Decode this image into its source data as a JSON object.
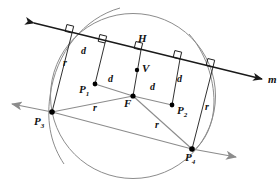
{
  "diagram": {
    "colors": {
      "line": "#1a1a1a",
      "arc": "#8c8c8c",
      "ray": "#8c8c8c",
      "point": "#000000",
      "label": "#111111"
    },
    "directrix": {
      "name": "m",
      "label": "m",
      "from": [
        30,
        22
      ],
      "to": [
        265,
        80
      ],
      "arrow_start": true,
      "arrow_end": true
    },
    "points": [
      {
        "id": "F",
        "label": "F",
        "sub": "",
        "x": 133,
        "y": 96,
        "label_x": 125,
        "label_y": 99,
        "dot": true
      },
      {
        "id": "V",
        "label": "V",
        "sub": "",
        "x": 137,
        "y": 70,
        "label_x": 142,
        "label_y": 64,
        "dot": true
      },
      {
        "id": "H",
        "label": "H",
        "sub": "",
        "x": 141,
        "y": 50,
        "label_x": 139,
        "label_y": 35,
        "dot": false
      },
      {
        "id": "P1",
        "label": "P",
        "sub": "1",
        "x": 95,
        "y": 84,
        "label_x": 79,
        "label_y": 85,
        "dot": true
      },
      {
        "id": "P2",
        "label": "P",
        "sub": "2",
        "x": 172,
        "y": 105,
        "label_x": 177,
        "label_y": 106,
        "dot": true
      },
      {
        "id": "P3",
        "label": "P",
        "sub": "3",
        "x": 52,
        "y": 112,
        "label_x": 35,
        "label_y": 117,
        "dot": true
      },
      {
        "id": "P4",
        "label": "P",
        "sub": "4",
        "x": 192,
        "y": 149,
        "label_x": 186,
        "label_y": 153,
        "dot": true
      }
    ],
    "segment_labels": [
      {
        "text": "d",
        "x": 83,
        "y": 52,
        "kind": "d"
      },
      {
        "text": "d",
        "x": 110,
        "y": 80,
        "kind": "d"
      },
      {
        "text": "d",
        "x": 152,
        "y": 88,
        "kind": "d"
      },
      {
        "text": "d",
        "x": 178,
        "y": 80,
        "kind": "d"
      },
      {
        "text": "r",
        "x": 64,
        "y": 63,
        "kind": "r"
      },
      {
        "text": "r",
        "x": 95,
        "y": 108,
        "kind": "r"
      },
      {
        "text": "r",
        "x": 157,
        "y": 125,
        "kind": "r"
      },
      {
        "text": "r",
        "x": 207,
        "y": 108,
        "kind": "r"
      }
    ],
    "right_angle_marks": [
      {
        "x": 72,
        "y": 34
      },
      {
        "x": 105,
        "y": 44
      },
      {
        "x": 141,
        "y": 52
      },
      {
        "x": 180,
        "y": 60
      },
      {
        "x": 213,
        "y": 68
      }
    ],
    "perpendiculars": [
      {
        "from": "foot-1",
        "x1": 72,
        "y1": 34,
        "x2": 52,
        "y2": 112
      },
      {
        "from": "foot-2",
        "x1": 105,
        "y1": 44,
        "x2": 95,
        "y2": 84
      },
      {
        "from": "foot-3",
        "x1": 141,
        "y1": 50,
        "x2": 133,
        "y2": 96
      },
      {
        "from": "foot-4",
        "x1": 180,
        "y1": 60,
        "x2": 172,
        "y2": 105
      },
      {
        "from": "foot-5",
        "x1": 213,
        "y1": 68,
        "x2": 192,
        "y2": 149
      }
    ],
    "radii": [
      {
        "from": "F",
        "to": "P1",
        "x1": 133,
        "y1": 96,
        "x2": 95,
        "y2": 84
      },
      {
        "from": "F",
        "to": "P2",
        "x1": 133,
        "y1": 96,
        "x2": 172,
        "y2": 105
      },
      {
        "from": "F",
        "to": "P3",
        "x1": 133,
        "y1": 96,
        "x2": 52,
        "y2": 112
      },
      {
        "from": "F",
        "to": "P4",
        "x1": 133,
        "y1": 96,
        "x2": 192,
        "y2": 149
      },
      {
        "from": "F",
        "to": "V",
        "x1": 133,
        "y1": 96,
        "x2": 137,
        "y2": 70
      }
    ],
    "rays": [
      {
        "name": "ray-P3",
        "x1": 52,
        "y1": 112,
        "x2": 10,
        "y2": 104,
        "arrow_end": true
      },
      {
        "name": "ray-P3-P4",
        "x1": 52,
        "y1": 112,
        "x2": 192,
        "y2": 149,
        "arrow_end": false
      },
      {
        "name": "ray-P4",
        "x1": 192,
        "y1": 149,
        "x2": 238,
        "y2": 157,
        "arrow_end": true
      }
    ],
    "arcs": [
      {
        "name": "main-circle",
        "cx": 133,
        "cy": 96,
        "r": 82,
        "desc": "circle centered at F through P3 and P4"
      },
      {
        "name": "arc-left",
        "cx": 133,
        "cy": 96,
        "r": 78,
        "desc": "construction arc left"
      },
      {
        "name": "arc-right",
        "cx": 133,
        "cy": 96,
        "r": 86,
        "desc": "construction arc right"
      }
    ]
  }
}
